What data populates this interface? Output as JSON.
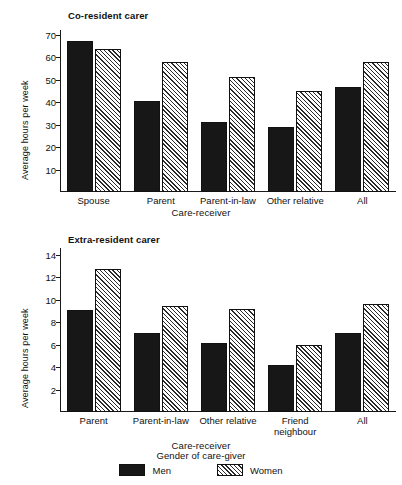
{
  "figure": {
    "background": "#ffffff",
    "ink": "#111111"
  },
  "legend": {
    "title": "Gender of care-giver",
    "items": [
      {
        "label": "Men",
        "swatch": "solid-black"
      },
      {
        "label": "Women",
        "swatch": "diagonal-hatch"
      }
    ]
  },
  "chart_data": [
    {
      "type": "bar",
      "title": "Co-resident carer",
      "xlabel": "Care-receiver",
      "ylabel": "Average hours per week",
      "categories": [
        "Spouse",
        "Parent",
        "Parent-in-law",
        "Other relative",
        "All"
      ],
      "series": [
        {
          "name": "Men",
          "values": [
            67,
            40.5,
            31,
            29,
            46.5
          ]
        },
        {
          "name": "Women",
          "values": [
            63.5,
            58,
            51,
            45,
            58
          ]
        }
      ],
      "ylim": [
        0,
        72
      ],
      "yticks": [
        10,
        20,
        30,
        40,
        50,
        60,
        70
      ],
      "grid": false,
      "legend_position": "bottom"
    },
    {
      "type": "bar",
      "title": "Extra-resident carer",
      "xlabel": "Care-receiver",
      "ylabel": "Average hours per week",
      "categories": [
        "Parent",
        "Parent-in-law",
        "Other relative",
        "Friend neighbour",
        "All"
      ],
      "series": [
        {
          "name": "Men",
          "values": [
            9.1,
            7.0,
            6.1,
            4.2,
            7.0
          ]
        },
        {
          "name": "Women",
          "values": [
            12.7,
            9.45,
            9.2,
            6.0,
            9.6
          ]
        }
      ],
      "ylim": [
        0,
        14.6
      ],
      "yticks": [
        2,
        4,
        6,
        8,
        10,
        12,
        14
      ],
      "grid": false,
      "legend_position": "bottom"
    }
  ]
}
